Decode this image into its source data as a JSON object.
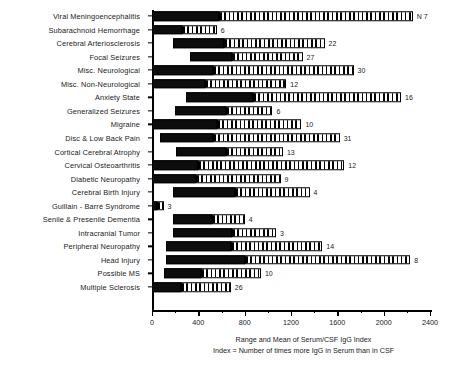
{
  "chart_data": {
    "type": "bar",
    "orientation": "horizontal",
    "title": "",
    "xlabel": "Range and Mean of Serum/CSF IgG Index",
    "sublabel": "Index = Number of times more IgG in Serum than in CSF",
    "ylabel": "",
    "xlim": [
      0,
      2400
    ],
    "xticks": [
      0,
      400,
      800,
      1200,
      1600,
      2000,
      2400
    ],
    "xtick_labels": [
      "0",
      "400",
      "800",
      "1200",
      "1600",
      "2000",
      "2400"
    ],
    "minor_tick_interval": 200,
    "grid": false,
    "legend": null,
    "n_header": "N",
    "first_row_n_label": "N 7",
    "value_meaning": "N = number of patients in each diagnostic group",
    "series_note": "Each bar spans the observed range; solid black segment runs from range minimum to the group mean, hatched segment from the mean to the range maximum.",
    "categories": [
      "Viral Meningoencephalitis",
      "Subarachnoid Hemorrhage",
      "Cerebral Arteriosclerosis",
      "Focal Seizures",
      "Misc. Neurological",
      "Misc. Non-Neurological",
      "Anxiety State",
      "Generalized Seizures",
      "Migraine",
      "Disc & Low Back Pain",
      "Cortical Cerebral Atrophy",
      "Cervical Osteoarthritis",
      "Diabetic Neuropathy",
      "Cerebral Birth Injury",
      "Guillain - Barré Syndrome",
      "Senile & Presenile Dementia",
      "Intracranial Tumor",
      "Peripheral Neuropathy",
      "Head Injury",
      "Possible MS",
      "Multiple Sclerosis"
    ],
    "n_values": [
      7,
      6,
      22,
      27,
      30,
      12,
      16,
      6,
      10,
      31,
      13,
      12,
      9,
      4,
      3,
      4,
      3,
      14,
      8,
      10,
      26
    ],
    "rows": [
      {
        "category": "Viral Meningoencephalitis",
        "n": 7,
        "min": 0,
        "mean": 580,
        "max": 2250
      },
      {
        "category": "Subarachnoid Hemorrhage",
        "n": 6,
        "min": 0,
        "mean": 260,
        "max": 560
      },
      {
        "category": "Cerebral Arteriosclerosis",
        "n": 22,
        "min": 180,
        "mean": 620,
        "max": 1490
      },
      {
        "category": "Focal Seizures",
        "n": 27,
        "min": 330,
        "mean": 690,
        "max": 1300
      },
      {
        "category": "Misc. Neurological",
        "n": 30,
        "min": 0,
        "mean": 530,
        "max": 1740
      },
      {
        "category": "Misc. Non-Neurological",
        "n": 12,
        "min": 0,
        "mean": 460,
        "max": 1160
      },
      {
        "category": "Anxiety State",
        "n": 16,
        "min": 290,
        "mean": 870,
        "max": 2150
      },
      {
        "category": "Generalized Seizures",
        "n": 6,
        "min": 200,
        "mean": 640,
        "max": 1040
      },
      {
        "category": "Migraine",
        "n": 10,
        "min": 0,
        "mean": 560,
        "max": 1290
      },
      {
        "category": "Disc & Low Back Pain",
        "n": 31,
        "min": 70,
        "mean": 530,
        "max": 1620
      },
      {
        "category": "Cortical Cerebral Atrophy",
        "n": 13,
        "min": 210,
        "mean": 640,
        "max": 1130
      },
      {
        "category": "Cervical Osteoarthritis",
        "n": 12,
        "min": 0,
        "mean": 400,
        "max": 1660
      },
      {
        "category": "Diabetic Neuropathy",
        "n": 9,
        "min": 0,
        "mean": 380,
        "max": 1110
      },
      {
        "category": "Cerebral Birth Injury",
        "n": 4,
        "min": 180,
        "mean": 720,
        "max": 1360
      },
      {
        "category": "Guillain - Barré Syndrome",
        "n": 3,
        "min": 0,
        "mean": 40,
        "max": 100
      },
      {
        "category": "Senile & Presenile Dementia",
        "n": 4,
        "min": 180,
        "mean": 520,
        "max": 800
      },
      {
        "category": "Intracranial Tumor",
        "n": 3,
        "min": 180,
        "mean": 690,
        "max": 1070
      },
      {
        "category": "Peripheral Neuropathy",
        "n": 14,
        "min": 120,
        "mean": 680,
        "max": 1470
      },
      {
        "category": "Head Injury",
        "n": 8,
        "min": 120,
        "mean": 800,
        "max": 2230
      },
      {
        "category": "Possible MS",
        "n": 10,
        "min": 100,
        "mean": 420,
        "max": 940
      },
      {
        "category": "Multiple Sclerosis",
        "n": 26,
        "min": 0,
        "mean": 250,
        "max": 680
      }
    ]
  }
}
